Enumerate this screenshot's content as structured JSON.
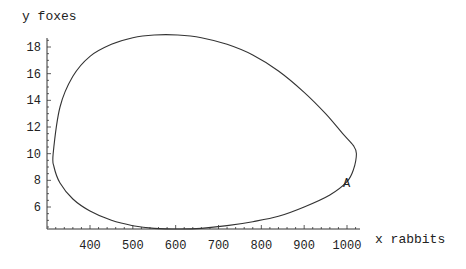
{
  "chart_data": {
    "type": "line",
    "title": "",
    "xlabel": "x rabbits",
    "ylabel": "y foxes",
    "xlim": [
      300,
      1030
    ],
    "ylim": [
      4.35,
      19.2
    ],
    "xticks": [
      400,
      500,
      600,
      700,
      800,
      900,
      1000
    ],
    "yticks": [
      6,
      8,
      10,
      12,
      14,
      16,
      18
    ],
    "grid": false,
    "legend": null,
    "series": [
      {
        "name": "phase trajectory",
        "x": [
          314,
          330,
          360,
          400,
          450,
          500,
          550,
          605,
          660,
          720,
          780,
          840,
          900,
          950,
          990,
          1015,
          1022,
          1015,
          1000,
          960,
          900,
          840,
          780,
          720,
          660,
          610,
          550,
          500,
          450,
          400,
          360,
          330,
          316,
          314
        ],
        "y": [
          10,
          13.5,
          15.8,
          17.3,
          18.2,
          18.7,
          18.9,
          18.9,
          18.7,
          18.2,
          17.4,
          16.2,
          14.6,
          13.0,
          11.5,
          10.6,
          10.0,
          8.8,
          7.9,
          6.9,
          6.0,
          5.3,
          4.9,
          4.6,
          4.4,
          4.35,
          4.4,
          4.6,
          5.0,
          5.7,
          6.6,
          7.8,
          9.0,
          10
        ]
      }
    ],
    "annotations": [
      {
        "text": "A",
        "x": 1000,
        "y": 7.9
      }
    ]
  },
  "labels": {
    "ylabel": "y foxes",
    "xlabel": "x rabbits",
    "marker": "A"
  },
  "colors": {
    "curve": "#333333",
    "axis": "#333333"
  }
}
